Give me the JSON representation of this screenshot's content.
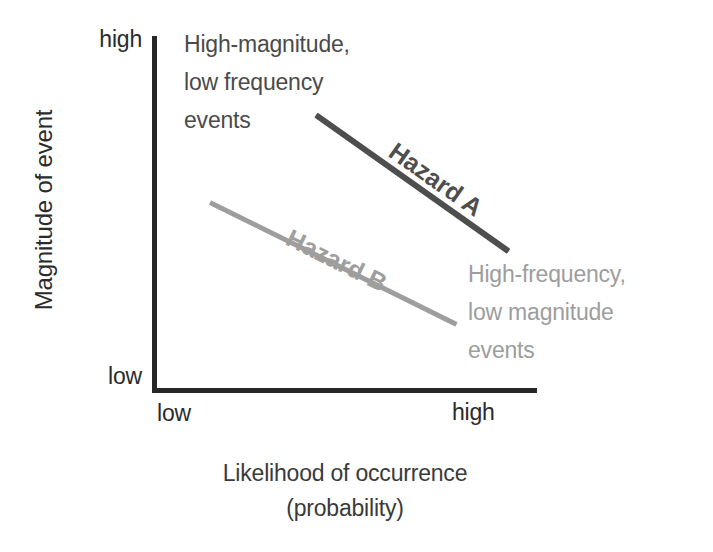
{
  "chart_data": {
    "type": "line",
    "title": "",
    "xlabel": "Likelihood of occurrence\n(probability)",
    "ylabel": "Magnitude of event",
    "xlabel_line1": "Likelihood of occurrence",
    "xlabel_line2": "(probability)",
    "x_tick_labels": [
      "low",
      "high"
    ],
    "y_tick_labels": [
      "low",
      "high"
    ],
    "xlim_labels": [
      "low",
      "high"
    ],
    "ylim_labels": [
      "low",
      "high"
    ],
    "grid": false,
    "legend": "inline-labels",
    "axes_color": "#272727",
    "series": [
      {
        "name": "Hazard A",
        "label": "Hazard A",
        "color": "#4e4e4e",
        "style": "solid",
        "weight": "bold",
        "x": [
          0.43,
          0.93
        ],
        "y": [
          0.78,
          0.4
        ],
        "description": "Steep downward trend in upper region: high magnitude at low-to-moderate likelihood, falling toward high likelihood"
      },
      {
        "name": "Hazard B",
        "label": "Hazard B",
        "color": "#9e9e9e",
        "style": "solid",
        "weight": "bold",
        "x": [
          0.15,
          0.79
        ],
        "y": [
          0.54,
          0.19
        ],
        "description": "Shallower downward trend in lower region: lower magnitude across the likelihood range"
      }
    ],
    "annotations": [
      {
        "id": "top-left",
        "text": "High-magnitude,\nlow frequency\nevents",
        "color": "#4a4a4a",
        "position": "upper-left quadrant"
      },
      {
        "id": "bottom-right",
        "text": "High-frequency,\nlow magnitude\nevents",
        "color": "#9d9d9d",
        "position": "lower-right quadrant"
      }
    ]
  },
  "axes": {
    "y_title": "Magnitude of event",
    "x_title_line1": "Likelihood of occurrence",
    "x_title_line2": "(probability)",
    "y_tick_high": "high",
    "y_tick_low": "low",
    "x_tick_low": "low",
    "x_tick_high": "high"
  },
  "annotations": {
    "top_left": "High-magnitude,\nlow frequency\nevents",
    "bottom_right": "High-frequency,\nlow magnitude\nevents"
  },
  "series_labels": {
    "hazard_a": "Hazard A",
    "hazard_b": "Hazard B"
  },
  "colors": {
    "axis": "#272727",
    "hazard_a": "#4e4e4e",
    "hazard_b": "#9e9e9e",
    "annotation_dark": "#4a4a4a",
    "annotation_light": "#9d9d9d",
    "background": "#ffffff"
  }
}
